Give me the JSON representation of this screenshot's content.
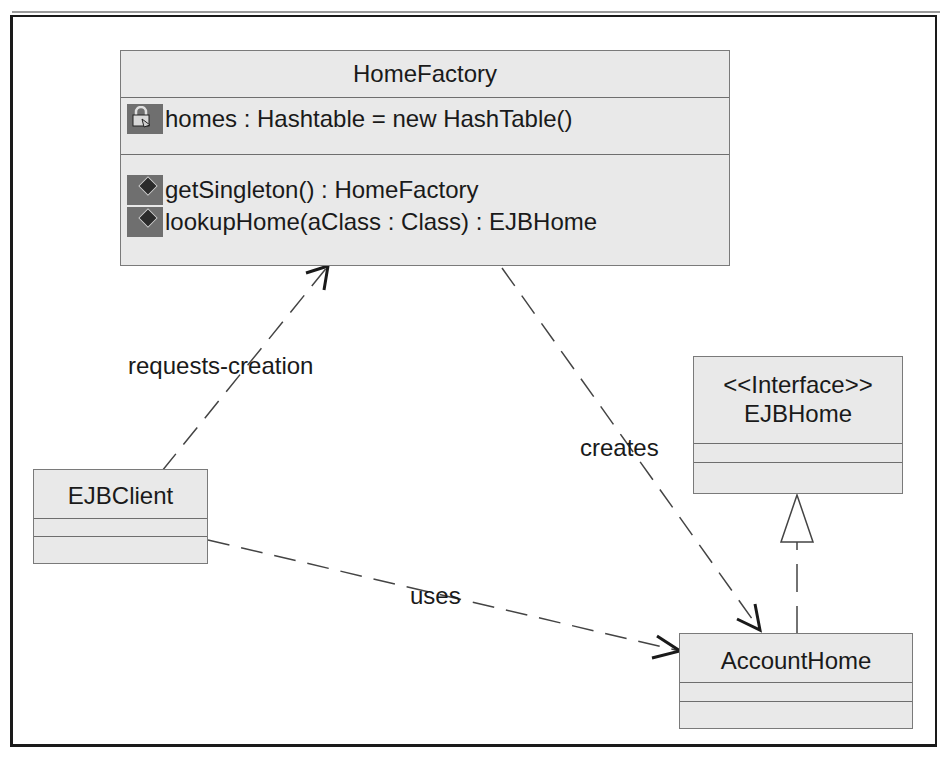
{
  "diagram": {
    "type": "UML class diagram",
    "classes": {
      "home_factory": {
        "name": "HomeFactory",
        "attributes": [
          {
            "visibility_icon": "private-lock-icon",
            "text": "homes : Hashtable = new HashTable()"
          }
        ],
        "operations": [
          {
            "visibility_icon": "public-diamond-icon",
            "text": "getSingleton() : HomeFactory"
          },
          {
            "visibility_icon": "public-diamond-icon",
            "text": "lookupHome(aClass : Class) : EJBHome"
          }
        ]
      },
      "ejb_home": {
        "stereotype": "<<Interface>>",
        "name": "EJBHome"
      },
      "ejb_client": {
        "name": "EJBClient"
      },
      "account_home": {
        "name": "AccountHome"
      }
    },
    "relationships": {
      "requests_creation": {
        "label": "requests-creation",
        "from": "EJBClient",
        "to": "HomeFactory",
        "kind": "dependency"
      },
      "creates": {
        "label": "creates",
        "from": "HomeFactory",
        "to": "AccountHome",
        "kind": "dependency"
      },
      "uses": {
        "label": "uses",
        "from": "EJBClient",
        "to": "AccountHome",
        "kind": "dependency"
      },
      "realizes": {
        "label": "",
        "from": "AccountHome",
        "to": "EJBHome",
        "kind": "realization"
      }
    },
    "colors": {
      "class_fill": "#e9e9e9",
      "class_border": "#7a7a7a",
      "icon_bg": "#6f6f6f",
      "line": "#444444",
      "frame": "#1a1a1a"
    }
  }
}
